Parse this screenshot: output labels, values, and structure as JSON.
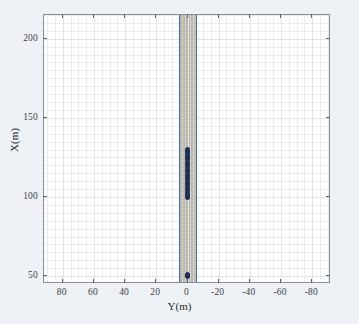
{
  "figure": {
    "background_color": "#eef2f7",
    "plot_background": "#ffffff",
    "frame_color": "#8b8f93"
  },
  "axes": {
    "x_title": "Y(m)",
    "y_title": "X(m)",
    "x_ticks": [
      "80",
      "60",
      "40",
      "20",
      "0",
      "-20",
      "-40",
      "-60",
      "-80"
    ],
    "y_ticks": [
      "50",
      "100",
      "150",
      "200"
    ]
  },
  "chart_data": {
    "type": "scatter",
    "title": "",
    "xlabel": "Y(m)",
    "ylabel": "X(m)",
    "xlim": [
      92,
      -92
    ],
    "ylim": [
      45,
      215
    ],
    "x_reversed": true,
    "grid": true,
    "minor_grid": true,
    "legend": "none",
    "xticks": [
      80,
      60,
      40,
      20,
      0,
      -20,
      -40,
      -60,
      -80
    ],
    "yticks": [
      50,
      100,
      150,
      200
    ],
    "series": [
      {
        "name": "vehicle-trajectory",
        "type": "scatter",
        "marker": "circle",
        "color": "#1f3864",
        "x": [
          0,
          0,
          0,
          0,
          0,
          0,
          0,
          0,
          0,
          0,
          0,
          0,
          0,
          0,
          0,
          0,
          0,
          0,
          0,
          0,
          0,
          0,
          0,
          0,
          0
        ],
        "y": [
          50,
          50.6,
          51.2,
          99.5,
          101,
          102.5,
          104,
          105.5,
          107,
          108.5,
          110,
          111.5,
          113,
          114.5,
          116,
          117.5,
          119,
          120.5,
          122,
          123.5,
          125,
          126.5,
          128,
          129,
          129.8
        ]
      },
      {
        "name": "road-left-edge",
        "type": "line",
        "color": "#3a6fb0",
        "x": [
          5.4,
          5.4
        ],
        "y": [
          45,
          215
        ]
      },
      {
        "name": "road-right-edge",
        "type": "line",
        "color": "#3a6fb0",
        "x": [
          -5.4,
          -5.4
        ],
        "y": [
          45,
          215
        ]
      },
      {
        "name": "road-surface-band",
        "type": "area",
        "color": "#c3c0b8",
        "x_range": [
          5.4,
          -5.4
        ],
        "y_range": [
          45,
          215
        ]
      }
    ]
  }
}
